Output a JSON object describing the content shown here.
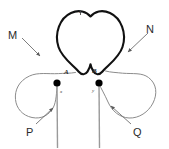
{
  "figure": {
    "canvas": {
      "width": 169,
      "height": 149,
      "background": "#ffffff"
    },
    "colors": {
      "heart_outline": "#111111",
      "loop_outline": "#8c8c8c",
      "vessel_line": "#9a9a9a",
      "leader_line": "#6e6e6e",
      "node_dot": "#000000",
      "label_text": "#2b2b2b"
    },
    "labels": [
      {
        "id": "L",
        "text": "L",
        "role": "heart-chamber-label",
        "kind": "tiny"
      },
      {
        "id": "M",
        "text": "M",
        "role": "left-loop-label",
        "kind": "major"
      },
      {
        "id": "N",
        "text": "N",
        "role": "right-loop-label",
        "kind": "major"
      },
      {
        "id": "P",
        "text": "P",
        "role": "left-vessel-label",
        "kind": "major"
      },
      {
        "id": "Q",
        "text": "Q",
        "role": "right-vessel-label",
        "kind": "major"
      },
      {
        "id": "A",
        "text": "A",
        "role": "left-junction-label",
        "kind": "node"
      },
      {
        "id": "B",
        "text": "B",
        "role": "right-junction-label",
        "kind": "node"
      },
      {
        "id": "x",
        "text": "x",
        "role": "left-node-label",
        "kind": "tiny"
      },
      {
        "id": "y",
        "text": "y",
        "role": "right-node-label",
        "kind": "tiny"
      }
    ],
    "nodes": [
      {
        "id": "left-dot",
        "cx": 57,
        "cy": 83,
        "r": 3.6
      },
      {
        "id": "right-dot",
        "cx": 99,
        "cy": 83,
        "r": 3.6
      }
    ],
    "leaders": [
      {
        "id": "M",
        "from": [
          22,
          38
        ],
        "to": [
          40,
          56
        ],
        "arrow": "end"
      },
      {
        "id": "N",
        "from": [
          148,
          33
        ],
        "to": [
          128,
          52
        ],
        "arrow": "end"
      },
      {
        "id": "P",
        "from": [
          36,
          124
        ],
        "to": [
          53,
          108
        ],
        "arrow": "end"
      },
      {
        "id": "Q",
        "from": [
          131,
          124
        ],
        "to": [
          111,
          106
        ],
        "arrow": "end"
      }
    ]
  }
}
